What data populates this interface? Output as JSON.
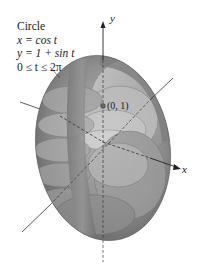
{
  "figure": {
    "title": "Circle",
    "equations": [
      "x = cos t",
      "y = 1 + sin t",
      "0 ≤ t ≤ 2π"
    ],
    "axes": {
      "x_label": "x",
      "y_label": "y"
    },
    "point": {
      "label": "(0, 1)"
    }
  }
}
